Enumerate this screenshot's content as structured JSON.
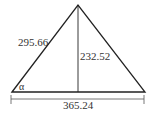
{
  "diagram": {
    "type": "triangle-with-altitude",
    "side_label": "295.66",
    "height_label": "232.52",
    "base_label": "365.24",
    "angle_label": "α",
    "colors": {
      "stroke": "#222222",
      "text": "#333333",
      "background": "#ffffff"
    }
  }
}
